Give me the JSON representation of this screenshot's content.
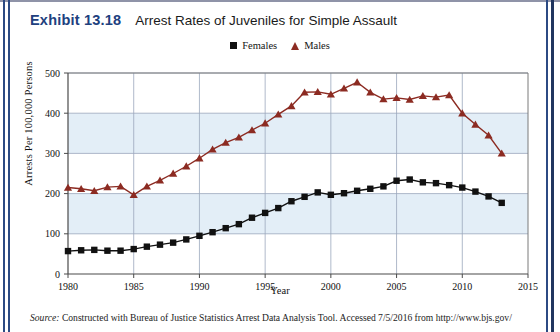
{
  "header": {
    "exhibit_label": "Exhibit 13.18",
    "title": "Arrest Rates of Juveniles for Simple Assault"
  },
  "legend": {
    "position": "top-center",
    "items": [
      {
        "label": "Females",
        "marker": "square",
        "color": "#111111"
      },
      {
        "label": "Males",
        "marker": "triangle",
        "color": "#8c2b22"
      }
    ]
  },
  "footer": {
    "source_word": "Source:",
    "source_text": " Constructed with Bureau of Justice Statistics Arrest Data Analysis Tool. Accessed 7/5/2016 from http://www.bjs.gov/"
  },
  "colors": {
    "accent_blue": "#20407e",
    "band_blue": "#e3eef7",
    "gridline": "#9aa7bd",
    "axis": "#555555",
    "females": "#111111",
    "males": "#8c2b22"
  },
  "chart_data": {
    "type": "line",
    "title": "Arrest Rates of Juveniles for Simple Assault",
    "xlabel": "Year",
    "ylabel": "Arrests Per 100,000 Persons",
    "xlim": [
      1980,
      2015
    ],
    "ylim": [
      0,
      500
    ],
    "xticks": [
      1980,
      1985,
      1990,
      1995,
      2000,
      2005,
      2010,
      2015
    ],
    "yticks": [
      0,
      100,
      200,
      300,
      400,
      500
    ],
    "grid": true,
    "banded_background": true,
    "x": [
      1980,
      1981,
      1982,
      1983,
      1984,
      1985,
      1986,
      1987,
      1988,
      1989,
      1990,
      1991,
      1992,
      1993,
      1994,
      1995,
      1996,
      1997,
      1998,
      1999,
      2000,
      2001,
      2002,
      2003,
      2004,
      2005,
      2006,
      2007,
      2008,
      2009,
      2010,
      2011,
      2012,
      2013
    ],
    "series": [
      {
        "name": "Females",
        "marker": "square",
        "color": "#111111",
        "values": [
          57,
          59,
          60,
          58,
          58,
          62,
          68,
          73,
          78,
          86,
          95,
          104,
          114,
          124,
          140,
          152,
          164,
          181,
          192,
          203,
          197,
          201,
          207,
          212,
          218,
          232,
          235,
          228,
          226,
          221,
          215,
          205,
          193,
          177
        ]
      },
      {
        "name": "Males",
        "marker": "triangle",
        "color": "#8c2b22",
        "values": [
          215,
          212,
          207,
          216,
          218,
          197,
          218,
          233,
          250,
          268,
          288,
          310,
          327,
          340,
          358,
          375,
          397,
          418,
          452,
          453,
          447,
          462,
          477,
          452,
          435,
          438,
          434,
          443,
          440,
          445,
          451,
          446,
          425,
          400
        ]
      }
    ],
    "series_males_tail": {
      "note": "continues declining to 2013",
      "x": [
        2010,
        2011,
        2012,
        2013
      ],
      "values": [
        400,
        372,
        345,
        300
      ]
    }
  }
}
